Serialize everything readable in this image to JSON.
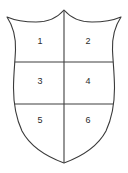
{
  "diagram": {
    "shape": "heraldic-shield",
    "colors": {
      "outline": "#3a3a3a",
      "divider": "#3f3f3f",
      "fill": "#ffffff",
      "background": "#ffffff",
      "label": "#2b2b2b"
    },
    "geometry": {
      "width": 128,
      "height": 173,
      "top_peak_x": 64,
      "top_peak_y": 10,
      "left_corner_x": 7,
      "left_corner_y": 17,
      "right_corner_x": 121,
      "right_corner_y": 17,
      "bottom_point_x": 64,
      "bottom_point_y": 163,
      "divider_row1_y": 62,
      "divider_row2_y": 104,
      "divider_col_x": 64
    },
    "cells": [
      {
        "label": "1",
        "position": "top-left",
        "x": 40,
        "y": 41
      },
      {
        "label": "2",
        "position": "top-right",
        "x": 88,
        "y": 41
      },
      {
        "label": "3",
        "position": "middle-left",
        "x": 40,
        "y": 81
      },
      {
        "label": "4",
        "position": "middle-right",
        "x": 88,
        "y": 81
      },
      {
        "label": "5",
        "position": "bottom-left",
        "x": 40,
        "y": 120
      },
      {
        "label": "6",
        "position": "bottom-right",
        "x": 88,
        "y": 120
      }
    ]
  }
}
